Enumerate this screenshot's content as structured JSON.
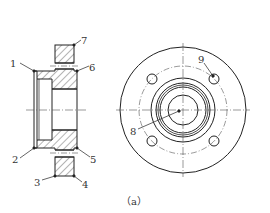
{
  "figure": {
    "caption": "（a）",
    "views": {
      "section": {
        "labels": [
          {
            "id": "1",
            "text": "1",
            "x": 14,
            "y": 67
          },
          {
            "id": "2",
            "text": "2",
            "x": 15,
            "y": 160
          },
          {
            "id": "3",
            "text": "3",
            "x": 37,
            "y": 184
          },
          {
            "id": "4",
            "text": "4",
            "x": 83,
            "y": 185
          },
          {
            "id": "5",
            "text": "5",
            "x": 92,
            "y": 162
          },
          {
            "id": "6",
            "text": "6",
            "x": 91,
            "y": 70
          },
          {
            "id": "7",
            "text": "7",
            "x": 82,
            "y": 44
          }
        ]
      },
      "front": {
        "labels": [
          {
            "id": "8",
            "text": "8",
            "x": 132,
            "y": 134
          },
          {
            "id": "9",
            "text": "9",
            "x": 198,
            "y": 62
          }
        ]
      }
    },
    "colors": {
      "line": "#222222",
      "hatch": "#444444",
      "centerline": "#555555",
      "text": "#333333"
    }
  }
}
